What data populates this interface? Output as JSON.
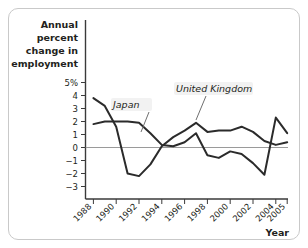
{
  "chart_data": {
    "type": "line",
    "title": "",
    "ylabel": "Annual percent change in employment",
    "xlabel": "Year",
    "ylim": [
      -3,
      5
    ],
    "yticks": [
      5,
      4,
      3,
      2,
      1,
      0,
      -1,
      -2,
      -3
    ],
    "ytick_labels": [
      "5%",
      "4",
      "3",
      "2",
      "1",
      "0",
      "−1",
      "−2",
      "−3"
    ],
    "xlim": [
      1988,
      2005
    ],
    "xticks": [
      1988,
      1990,
      1992,
      1994,
      1996,
      1998,
      2000,
      2002,
      2004,
      2005
    ],
    "xtick_labels": [
      "1988",
      "1990",
      "1992",
      "1994",
      "1996",
      "1998",
      "2000",
      "2002",
      "2004",
      "2005"
    ],
    "grid": false,
    "legend_position": "inline-annotation",
    "x": [
      1988,
      1989,
      1990,
      1991,
      1992,
      1993,
      1994,
      1995,
      1996,
      1997,
      1998,
      1999,
      2000,
      2001,
      2002,
      2003,
      2004,
      2005
    ],
    "series": [
      {
        "name": "Japan",
        "color": "#2b2b2b",
        "values": [
          1.8,
          2.0,
          2.0,
          2.0,
          1.9,
          1.1,
          0.2,
          0.1,
          0.4,
          1.1,
          -0.6,
          -0.8,
          -0.3,
          -0.5,
          -1.2,
          -2.1,
          2.3,
          1.1
        ]
      },
      {
        "name": "United Kingdom",
        "color": "#2b2b2b",
        "values": [
          3.8,
          3.2,
          1.6,
          -2.0,
          -2.2,
          -1.3,
          0.1,
          0.8,
          1.3,
          1.9,
          1.2,
          1.3,
          1.3,
          1.6,
          1.2,
          0.5,
          0.2,
          0.4
        ]
      }
    ],
    "annotations": [
      {
        "text": "Japan",
        "series": "Japan"
      },
      {
        "text": "United Kingdom",
        "series": "United Kingdom"
      }
    ]
  },
  "axes": {
    "y_title_lines": [
      "Annual",
      "percent",
      "change in",
      "employment"
    ],
    "x_title": "Year"
  }
}
